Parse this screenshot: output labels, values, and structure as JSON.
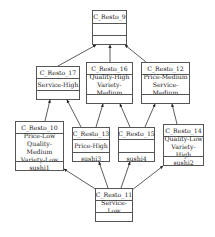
{
  "diagram": {
    "type": "concept-lattice",
    "nodes": [
      {
        "id": "C_Resto_9",
        "title": "C_Resto_9",
        "intent": [],
        "extent": [],
        "box": [
          92,
          10,
          35,
          35
        ],
        "rows": [
          12,
          11,
          12
        ]
      },
      {
        "id": "C_Resto_17",
        "title": "C_Resto_17",
        "intent": [
          "Service-High"
        ],
        "extent": [],
        "box": [
          36,
          66,
          44,
          34
        ],
        "rows": [
          11,
          11,
          12
        ]
      },
      {
        "id": "C_Resto_16",
        "title": "C_Resto_16",
        "intent": [
          "Quality-High",
          "Variety-Medium"
        ],
        "extent": [],
        "box": [
          86,
          62,
          47,
          42
        ],
        "rows": [
          11,
          19,
          12
        ]
      },
      {
        "id": "C_Resto_12",
        "title": "C_Resto_12",
        "intent": [
          "Price-Medium",
          "Service-Medium"
        ],
        "extent": [],
        "box": [
          141,
          62,
          49,
          42
        ],
        "rows": [
          11,
          19,
          12
        ]
      },
      {
        "id": "C_Resto_10",
        "title": "C_Resto_10",
        "intent": [
          "Price-Low",
          "Quality-Medium",
          "Variety-Low"
        ],
        "extent": [
          "sushi1"
        ],
        "box": [
          15,
          121,
          49,
          50
        ],
        "rows": [
          11,
          27,
          12
        ]
      },
      {
        "id": "C_Resto_13",
        "title": "C_Resto_13",
        "intent": [
          "Price-High"
        ],
        "extent": [
          "sushi3"
        ],
        "box": [
          72,
          127,
          38,
          35
        ],
        "rows": [
          11,
          12,
          12
        ]
      },
      {
        "id": "C_Resto_15",
        "title": "C_Resto_15",
        "intent": [],
        "extent": [
          "sushi4"
        ],
        "box": [
          118,
          127,
          37,
          35
        ],
        "rows": [
          11,
          12,
          12
        ]
      },
      {
        "id": "C_Resto_14",
        "title": "C_Resto_14",
        "intent": [
          "Quality-Low",
          "Variety-High"
        ],
        "extent": [
          "sushi2"
        ],
        "box": [
          163,
          124,
          41,
          42
        ],
        "rows": [
          11,
          19,
          12
        ]
      },
      {
        "id": "C_Resto_11",
        "title": "C_Resto_11",
        "intent": [
          "Service-Low"
        ],
        "extent": [],
        "box": [
          95,
          188,
          38,
          34
        ],
        "rows": [
          11,
          11,
          12
        ]
      }
    ],
    "edges": [
      {
        "from": "C_Resto_17",
        "to": "C_Resto_9",
        "x1": 58,
        "y1": 66,
        "x2": 96,
        "y2": 45
      },
      {
        "from": "C_Resto_16",
        "to": "C_Resto_9",
        "x1": 110,
        "y1": 62,
        "x2": 110,
        "y2": 45
      },
      {
        "from": "C_Resto_12",
        "to": "C_Resto_9",
        "x1": 146,
        "y1": 62,
        "x2": 125,
        "y2": 45
      },
      {
        "from": "C_Resto_10",
        "to": "C_Resto_17",
        "x1": 45,
        "y1": 121,
        "x2": 50,
        "y2": 100
      },
      {
        "from": "C_Resto_13",
        "to": "C_Resto_17",
        "x1": 81,
        "y1": 127,
        "x2": 67,
        "y2": 100
      },
      {
        "from": "C_Resto_13",
        "to": "C_Resto_16",
        "x1": 96,
        "y1": 127,
        "x2": 103,
        "y2": 104
      },
      {
        "from": "C_Resto_15",
        "to": "C_Resto_16",
        "x1": 130,
        "y1": 127,
        "x2": 120,
        "y2": 104
      },
      {
        "from": "C_Resto_15",
        "to": "C_Resto_12",
        "x1": 145,
        "y1": 127,
        "x2": 155,
        "y2": 104
      },
      {
        "from": "C_Resto_14",
        "to": "C_Resto_12",
        "x1": 177,
        "y1": 124,
        "x2": 172,
        "y2": 104
      },
      {
        "from": "C_Resto_11",
        "to": "C_Resto_10",
        "x1": 97,
        "y1": 190,
        "x2": 64,
        "y2": 169
      },
      {
        "from": "C_Resto_11",
        "to": "C_Resto_13",
        "x1": 108,
        "y1": 188,
        "x2": 99,
        "y2": 162
      },
      {
        "from": "C_Resto_11",
        "to": "C_Resto_15",
        "x1": 121,
        "y1": 188,
        "x2": 130,
        "y2": 162
      },
      {
        "from": "C_Resto_11",
        "to": "C_Resto_14",
        "x1": 132,
        "y1": 190,
        "x2": 163,
        "y2": 166
      }
    ]
  },
  "colors": {
    "line": "#333333",
    "border": "#555555",
    "text": "#222222",
    "background": "#ffffff"
  }
}
